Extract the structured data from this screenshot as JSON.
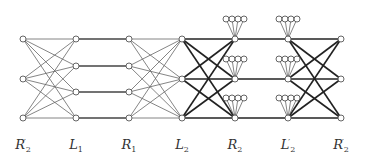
{
  "diagram": {
    "type": "layered-graph",
    "columns": [
      {
        "id": "c0",
        "name": "R",
        "sub": "2",
        "prime": "′",
        "x": 23,
        "nodes": [
          39,
          79,
          118
        ]
      },
      {
        "id": "c1",
        "name": "L",
        "sub": "1",
        "prime": "",
        "x": 76,
        "nodes": [
          39,
          66,
          92,
          118
        ]
      },
      {
        "id": "c2",
        "name": "R",
        "sub": "1",
        "prime": "",
        "x": 129,
        "nodes": [
          39,
          66,
          92,
          118
        ]
      },
      {
        "id": "c3",
        "name": "L",
        "sub": "2",
        "prime": "",
        "x": 182,
        "nodes": [
          39,
          79,
          118
        ]
      },
      {
        "id": "c4",
        "name": "R",
        "sub": "2",
        "prime": "",
        "x": 235,
        "nodes": [
          39,
          79,
          118
        ]
      },
      {
        "id": "c5",
        "name": "L",
        "sub": "2",
        "prime": "′",
        "x": 288,
        "nodes": [
          39,
          79,
          118
        ]
      },
      {
        "id": "c6",
        "name": "R",
        "sub": "2",
        "prime": "′",
        "x": 341,
        "nodes": [
          39,
          79,
          118
        ]
      }
    ],
    "edges": [
      {
        "from": "c0",
        "to": "c1",
        "style": "complete",
        "weight": "thin"
      },
      {
        "from": "c1",
        "to": "c2",
        "style": "matching",
        "weight": "medium"
      },
      {
        "from": "c2",
        "to": "c3",
        "style": "complete",
        "weight": "thin"
      },
      {
        "from": "c3",
        "to": "c4",
        "style": "complete",
        "weight": "thick"
      },
      {
        "from": "c4",
        "to": "c5",
        "style": "matching",
        "weight": "thick"
      },
      {
        "from": "c5",
        "to": "c6",
        "style": "complete",
        "weight": "thick"
      }
    ],
    "pendant_fans": {
      "columns": [
        "c4",
        "c5"
      ],
      "leaves_per_node": 4
    },
    "colors": {
      "edge_thin": "#666666",
      "edge_medium": "#444444",
      "edge_thick": "#222222",
      "node_stroke": "#555555",
      "node_fill": "#ffffff",
      "label": "#333333"
    }
  }
}
